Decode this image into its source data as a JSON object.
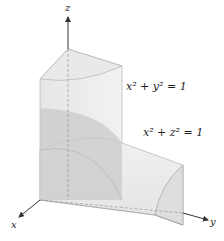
{
  "figure": {
    "axes": {
      "x_label": "x",
      "y_label": "y",
      "z_label": "z"
    },
    "equations": [
      {
        "text": "x² + y² = 1"
      },
      {
        "text": "x² + z² = 1"
      }
    ],
    "colors": {
      "surface_light": "#ececec",
      "surface_mid": "#dcdcdc",
      "surface_dark": "#bdbdbd",
      "edge": "#9a9a9a",
      "axis": "#333333"
    }
  }
}
